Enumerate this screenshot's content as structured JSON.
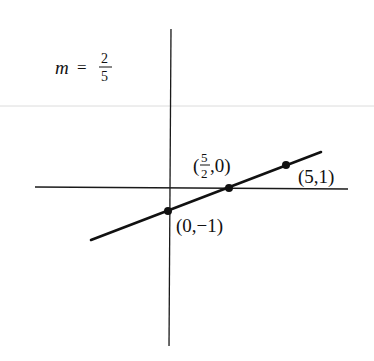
{
  "figure": {
    "slope_label": {
      "var": "m",
      "eq": "=",
      "num": "2",
      "den": "5"
    },
    "line_equation_slope": "2/5",
    "points": [
      {
        "id": "y-intercept",
        "label": "(0,−1)",
        "x": 0,
        "y": -1
      },
      {
        "id": "x-intercept",
        "label_num": "5",
        "label_den": "2",
        "label_prefix": "(",
        "label_suffix": ",0)",
        "x": 2.5,
        "y": 0
      },
      {
        "id": "point-5-1",
        "label": "(5,1)",
        "x": 5,
        "y": 1
      }
    ],
    "colors": {
      "axis": "#1a1a1a",
      "line": "#111111",
      "faint_rule": "#d8d8d8",
      "background": "#ffffff"
    }
  }
}
